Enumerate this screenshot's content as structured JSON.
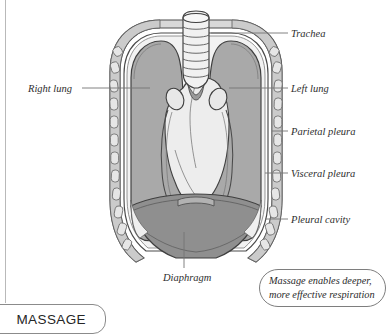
{
  "page": {
    "background_color": "#ffffff",
    "rule_color": "#b9b9b9"
  },
  "diagram": {
    "name": "thorax-cross-section",
    "colors": {
      "lung_fill": "#a9a9a9",
      "lung_outline": "#4a4a4a",
      "pleural_cavity_fill": "#efefef",
      "chest_wall_fill": "#d4d4d4",
      "rib_fill": "#e4e4e4",
      "rib_outline": "#6d6d6d",
      "heart_fill": "#ebebeb",
      "heart_outline": "#4a4a4a",
      "trachea_fill": "#f0f0f0",
      "trachea_outline": "#4a4a4a",
      "diaphragm_fill": "#8d8d8d",
      "diaphragm_outline": "#4a4a4a",
      "leader_line": "#707070"
    },
    "structures": [
      "trachea",
      "right lung",
      "left lung",
      "parietal pleura",
      "visceral pleura",
      "pleural cavity",
      "diaphragm",
      "heart",
      "bronchi",
      "ribs"
    ]
  },
  "labels": {
    "trachea": "Trachea",
    "left_lung": "Left lung",
    "parietal_pleura": "Parietal pleura",
    "visceral_pleura": "Visceral pleura",
    "pleural_cavity": "Pleural cavity",
    "right_lung": "Right lung",
    "diaphragm": "Diaphragm"
  },
  "callout": {
    "line1": "Massage enables deeper,",
    "line2": "more effective respiration"
  },
  "chapter_tab": {
    "label": "MASSAGE"
  }
}
